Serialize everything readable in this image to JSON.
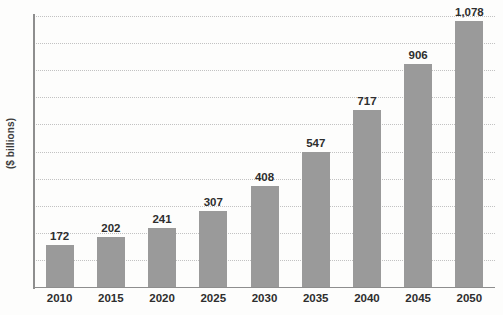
{
  "chart_data": {
    "type": "bar",
    "title": "",
    "subtitle": "",
    "xlabel": "",
    "ylabel": "($ billions)",
    "categories": [
      "2010",
      "2015",
      "2020",
      "2025",
      "2030",
      "2035",
      "2040",
      "2045",
      "2050"
    ],
    "values": [
      172,
      202,
      241,
      307,
      408,
      547,
      717,
      906,
      1078
    ],
    "value_labels": [
      "172",
      "202",
      "241",
      "307",
      "408",
      "547",
      "717",
      "906",
      "1,078"
    ],
    "series": [
      {
        "name": "",
        "values": [
          172,
          202,
          241,
          307,
          408,
          547,
          717,
          906,
          1078
        ]
      }
    ],
    "ylim": [
      0,
      1100
    ],
    "y_tick_labels": [],
    "grid": true,
    "gridline_style": "dotted-horizontal",
    "gridline_count": 11,
    "legend": false,
    "legend_position": "none",
    "annotations": [],
    "colors": {
      "bar_fill": "#9a9a9a",
      "gridline": "#c2c2c2",
      "axis_line": "#8e8e8e",
      "text": "#2e2e2e",
      "axis_title_text": "#3b3b3b",
      "background": "#fdfdfc"
    }
  }
}
